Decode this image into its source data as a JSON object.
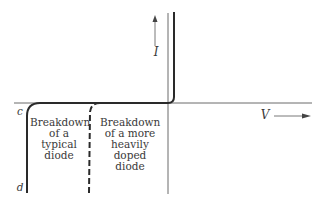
{
  "diagram": {
    "type": "diode I-V characteristic",
    "axes": {
      "x_label": "V",
      "y_label": "I"
    },
    "points": {
      "c": "c",
      "d": "d"
    },
    "annotations": {
      "typical": [
        "Breakdown",
        "of a",
        "typical",
        "diode"
      ],
      "heavily_doped": [
        "Breakdown",
        "of a more",
        "heavily",
        "doped",
        "diode"
      ]
    },
    "colors": {
      "curve": "#2a2a2a",
      "axis": "#6a6a6a",
      "text": "#3a3a3a"
    }
  }
}
